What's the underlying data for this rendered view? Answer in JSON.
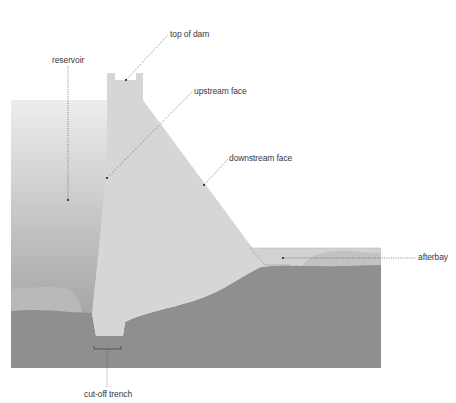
{
  "diagram": {
    "labels": {
      "top_of_dam": "top of dam",
      "reservoir": "reservoir",
      "upstream_face": "upstream face",
      "downstream_face": "downstream face",
      "afterbay": "afterbay",
      "cut_off_trench": "cut-off trench"
    },
    "colors": {
      "background": "#ffffff",
      "reservoir_top": "#ececec",
      "reservoir_bottom": "#a9a9a9",
      "dam_body": "#d6d6d6",
      "ground": "#8f8f8f",
      "sediment": "#b8b8b8",
      "afterbay_water": "#cfcfcf",
      "leader_line": "#555555",
      "text": "#3a3a3a"
    }
  }
}
